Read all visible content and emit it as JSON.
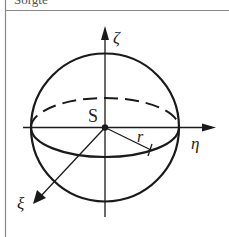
{
  "header": {
    "text": "Sorgte"
  },
  "diagram": {
    "labels": {
      "zeta": "ζ",
      "eta": "η",
      "xi": "ξ",
      "center": "S",
      "radius": "r"
    },
    "colors": {
      "stroke": "#1a1a1a",
      "border": "#888888",
      "background": "#ffffff"
    }
  }
}
